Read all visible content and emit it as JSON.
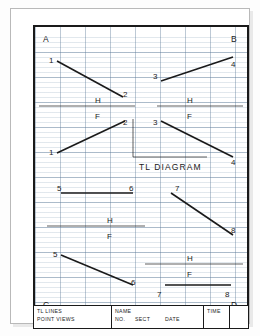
{
  "drawing": {
    "title_text": "TL DIAGRAM",
    "corner_labels": [
      {
        "name": "A",
        "text": "A",
        "x": 8,
        "y": 8
      },
      {
        "name": "B",
        "text": "B",
        "x": 196,
        "y": 8
      },
      {
        "name": "C",
        "text": "C",
        "x": 8,
        "y": 274
      },
      {
        "name": "D",
        "text": "D",
        "x": 196,
        "y": 274
      }
    ],
    "reference_labels": [
      {
        "name": "quad-a-h",
        "text": "H",
        "x": 60,
        "y": 70
      },
      {
        "name": "quad-a-f",
        "text": "F",
        "x": 60,
        "y": 86
      },
      {
        "name": "quad-b-h",
        "text": "H",
        "x": 152,
        "y": 70
      },
      {
        "name": "quad-b-f",
        "text": "F",
        "x": 152,
        "y": 86
      },
      {
        "name": "quad-c-h",
        "text": "H",
        "x": 72,
        "y": 190
      },
      {
        "name": "quad-c-f",
        "text": "F",
        "x": 72,
        "y": 206
      },
      {
        "name": "quad-d-h",
        "text": "H",
        "x": 152,
        "y": 228
      },
      {
        "name": "quad-d-f",
        "text": "F",
        "x": 152,
        "y": 244
      }
    ],
    "point_labels": [
      {
        "name": "a-top-1",
        "text": "1",
        "x": 14,
        "y": 30
      },
      {
        "name": "a-top-2",
        "text": "2",
        "x": 88,
        "y": 64
      },
      {
        "name": "a-bot-2",
        "text": "2",
        "x": 88,
        "y": 92
      },
      {
        "name": "a-bot-1",
        "text": "1",
        "x": 14,
        "y": 122
      },
      {
        "name": "b-top-3",
        "text": "3",
        "x": 118,
        "y": 46
      },
      {
        "name": "b-top-4",
        "text": "4",
        "x": 196,
        "y": 34
      },
      {
        "name": "b-bot-3",
        "text": "3",
        "x": 118,
        "y": 92
      },
      {
        "name": "b-bot-4",
        "text": "4",
        "x": 196,
        "y": 132
      },
      {
        "name": "c-top-5",
        "text": "5",
        "x": 22,
        "y": 158
      },
      {
        "name": "c-top-6",
        "text": "6",
        "x": 94,
        "y": 158
      },
      {
        "name": "c-bot-5",
        "text": "5",
        "x": 18,
        "y": 224
      },
      {
        "name": "c-bot-6",
        "text": "6",
        "x": 96,
        "y": 252
      },
      {
        "name": "d-top-7",
        "text": "7",
        "x": 140,
        "y": 158
      },
      {
        "name": "d-top-8",
        "text": "8",
        "x": 196,
        "y": 200
      },
      {
        "name": "d-bot-7",
        "text": "7",
        "x": 122,
        "y": 264
      },
      {
        "name": "d-bot-8",
        "text": "8",
        "x": 190,
        "y": 264
      }
    ],
    "segments": [
      {
        "name": "line-1-2-top",
        "x1": 22,
        "y1": 34,
        "x2": 88,
        "y2": 70,
        "weight": "heavy"
      },
      {
        "name": "line-1-2-bottom",
        "x1": 22,
        "y1": 126,
        "x2": 90,
        "y2": 94,
        "weight": "heavy"
      },
      {
        "name": "line-3-4-top",
        "x1": 126,
        "y1": 54,
        "x2": 198,
        "y2": 30,
        "weight": "heavy"
      },
      {
        "name": "line-3-4-bottom",
        "x1": 126,
        "y1": 94,
        "x2": 198,
        "y2": 130,
        "weight": "heavy"
      },
      {
        "name": "line-5-6-top",
        "x1": 26,
        "y1": 166,
        "x2": 98,
        "y2": 166,
        "weight": "heavy"
      },
      {
        "name": "line-5-6-bottom",
        "x1": 26,
        "y1": 228,
        "x2": 98,
        "y2": 258,
        "weight": "heavy"
      },
      {
        "name": "line-7-8-top",
        "x1": 136,
        "y1": 166,
        "x2": 198,
        "y2": 208,
        "weight": "heavy"
      },
      {
        "name": "line-7-8-bottom",
        "x1": 130,
        "y1": 258,
        "x2": 196,
        "y2": 258,
        "weight": "heavy"
      },
      {
        "name": "hf-line-quad-a",
        "x1": 4,
        "y1": 79,
        "x2": 100,
        "y2": 79,
        "weight": "thin"
      },
      {
        "name": "hf-line-quad-b",
        "x1": 122,
        "y1": 79,
        "x2": 208,
        "y2": 79,
        "weight": "thin"
      },
      {
        "name": "hf-line-quad-c",
        "x1": 12,
        "y1": 199,
        "x2": 110,
        "y2": 199,
        "weight": "thin"
      },
      {
        "name": "hf-line-quad-d",
        "x1": 110,
        "y1": 237,
        "x2": 208,
        "y2": 237,
        "weight": "thin"
      },
      {
        "name": "tl-bracket-vertical",
        "x1": 98,
        "y1": 92,
        "x2": 98,
        "y2": 130,
        "weight": "thin"
      },
      {
        "name": "tl-bracket-horizontal",
        "x1": 98,
        "y1": 130,
        "x2": 172,
        "y2": 130,
        "weight": "thin"
      }
    ],
    "tl_label_position": {
      "x": 104,
      "y": 136
    }
  },
  "title_block": {
    "left_line1": "TL LINES",
    "left_line2": "POINT VIEWS",
    "name_label": "NAME",
    "no_label": "NO.",
    "sect_label": "SECT",
    "date_label": "DATE",
    "time_label": "TIME",
    "blank_label": ""
  },
  "colors": {
    "ink": "#1a1a1a",
    "grid_minor": "#9fb4c8",
    "grid_major": "#6f8ca8",
    "paper": "#ffffff",
    "sheet_border": "#b9b9b9"
  }
}
